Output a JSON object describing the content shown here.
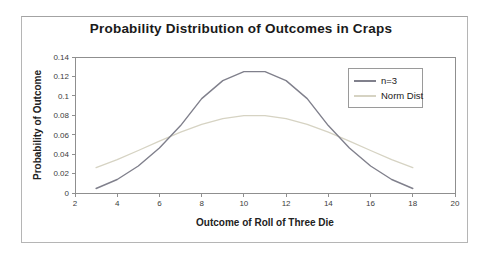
{
  "chart_data": {
    "type": "line",
    "title": "Probability Distribution of Outcomes in Craps",
    "xlabel": "Outcome of Roll of Three Die",
    "ylabel": "Probability of Outcome",
    "xlim": [
      2,
      20
    ],
    "ylim": [
      0,
      0.14
    ],
    "x_ticks": [
      2,
      4,
      6,
      8,
      10,
      12,
      14,
      16,
      18,
      20
    ],
    "y_ticks": [
      0,
      0.02,
      0.04,
      0.06,
      0.08,
      0.1,
      0.12,
      0.14
    ],
    "y_tick_labels": [
      "0",
      "0.02",
      "0.04",
      "0.06",
      "0.08",
      "0.1",
      "0.12",
      "0.14"
    ],
    "grid": false,
    "legend_position": "top-right-inside",
    "x": [
      3,
      4,
      5,
      6,
      7,
      8,
      9,
      10,
      11,
      12,
      13,
      14,
      15,
      16,
      17,
      18
    ],
    "series": [
      {
        "name": "n=3",
        "color": "#80808c",
        "values": [
          0.0046,
          0.0139,
          0.0278,
          0.0463,
          0.0694,
          0.0972,
          0.1157,
          0.125,
          0.125,
          0.1157,
          0.0972,
          0.0694,
          0.0463,
          0.0278,
          0.0139,
          0.0046
        ]
      },
      {
        "name": "Norm Dist",
        "color": "#d6d3c3",
        "values": [
          0.026,
          0.0344,
          0.0437,
          0.0534,
          0.0626,
          0.0706,
          0.0765,
          0.0796,
          0.0796,
          0.0765,
          0.0706,
          0.0626,
          0.0534,
          0.0437,
          0.0344,
          0.026
        ]
      }
    ],
    "axis_color": "#8f8f8f",
    "tick_label_color": "#3c3c3c"
  }
}
